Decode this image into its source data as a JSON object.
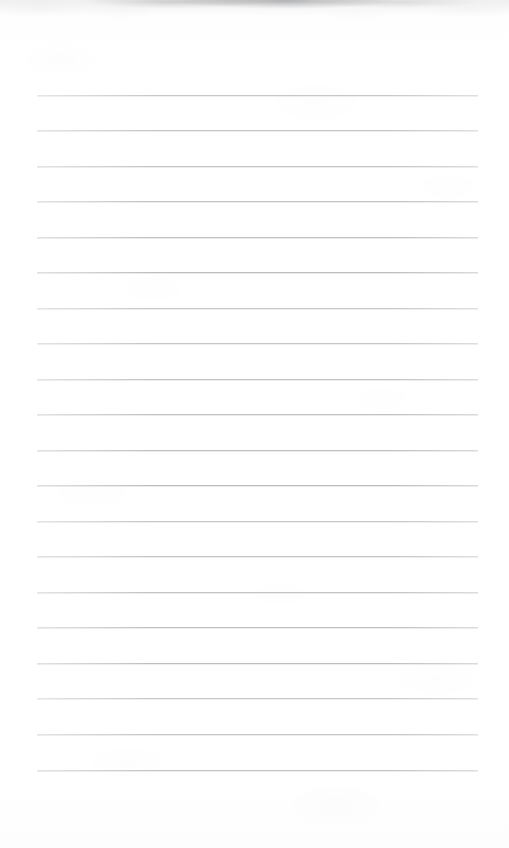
{
  "document": {
    "kind": "scanned-lined-paper",
    "title": "Lined notebook paper scan",
    "page_width": 509,
    "page_height": 848,
    "background_color": "#fefefe",
    "paper_color": "#ffffff",
    "content_text": "",
    "has_handwriting": false,
    "has_printed_text": false
  },
  "ruling": {
    "line_color": "#b9bbbd",
    "line_thickness_px": 1,
    "line_count": 20,
    "left_margin_px": 37,
    "right_edge_px": 478,
    "line_width_px": 441,
    "first_line_y_px": 95,
    "line_spacing_px": 35.5,
    "last_line_y_px": 770,
    "lines_y": [
      95,
      130,
      166,
      201,
      237,
      272,
      308,
      343,
      379,
      414,
      450,
      485,
      521,
      556,
      592,
      627,
      663,
      698,
      734,
      770
    ]
  },
  "artifacts": {
    "top_smudge": {
      "label": "scan shadow smudge",
      "color": "#6e7074",
      "x_px": 0,
      "y_px": 0,
      "width_px": 509,
      "height_px": 16
    },
    "texture_label": "faint paper grain",
    "vignette_label": "scanner edge vignette"
  },
  "margins": {
    "top_blank_px": 95,
    "bottom_blank_px": 78,
    "left_blank_px": 37,
    "right_blank_px": 31
  }
}
